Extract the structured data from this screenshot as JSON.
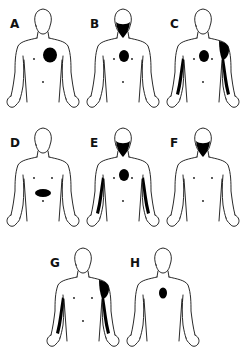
{
  "figure": {
    "panels": [
      {
        "id": "A",
        "label": "A",
        "view": "front",
        "x": 3,
        "y": 4,
        "shaded_regions": [
          "left-chest"
        ]
      },
      {
        "id": "B",
        "label": "B",
        "view": "front",
        "x": 83,
        "y": 4,
        "shaded_regions": [
          "jaw-neck",
          "center-chest"
        ]
      },
      {
        "id": "C",
        "label": "C",
        "view": "front",
        "x": 163,
        "y": 4,
        "shaded_regions": [
          "center-chest",
          "left-shoulder",
          "left-arm",
          "right-arm"
        ]
      },
      {
        "id": "D",
        "label": "D",
        "view": "front",
        "x": 3,
        "y": 123,
        "shaded_regions": [
          "epigastrium"
        ]
      },
      {
        "id": "E",
        "label": "E",
        "view": "front",
        "x": 83,
        "y": 123,
        "shaded_regions": [
          "jaw-neck",
          "center-chest",
          "left-arm",
          "right-arm"
        ]
      },
      {
        "id": "F",
        "label": "F",
        "view": "front",
        "x": 163,
        "y": 123,
        "shaded_regions": [
          "jaw-neck"
        ]
      },
      {
        "id": "G",
        "label": "G",
        "view": "front",
        "x": 43,
        "y": 243,
        "shaded_regions": [
          "left-shoulder",
          "left-arm",
          "right-arm"
        ]
      },
      {
        "id": "H",
        "label": "H",
        "view": "back",
        "x": 123,
        "y": 243,
        "shaded_regions": [
          "upper-back"
        ]
      }
    ],
    "colors": {
      "ink": "#111111",
      "background": "#ffffff",
      "shade": "#000000"
    }
  }
}
